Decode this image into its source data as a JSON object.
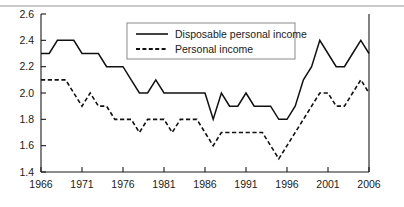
{
  "chart_data": {
    "type": "line",
    "title": "",
    "subtitle": "",
    "xlabel": "",
    "ylabel": "",
    "xlim": [
      1966,
      2006
    ],
    "ylim": [
      1.4,
      2.6
    ],
    "grid": false,
    "legend_position": "top-right",
    "x_tick_labels": [
      "1966",
      "1971",
      "1976",
      "1981",
      "1986",
      "1991",
      "1996",
      "2001",
      "2006"
    ],
    "x_ticks": [
      1966,
      1971,
      1976,
      1981,
      1986,
      1991,
      1996,
      2001,
      2006
    ],
    "y_tick_labels": [
      "1.4",
      "1.6",
      "1.8",
      "2.0",
      "2.2",
      "2.4",
      "2.6"
    ],
    "y_ticks": [
      1.4,
      1.6,
      1.8,
      2.0,
      2.2,
      2.4,
      2.6
    ],
    "x": [
      1966,
      1967,
      1968,
      1969,
      1970,
      1971,
      1972,
      1973,
      1974,
      1975,
      1976,
      1977,
      1978,
      1979,
      1980,
      1981,
      1982,
      1983,
      1984,
      1985,
      1986,
      1987,
      1988,
      1989,
      1990,
      1991,
      1992,
      1993,
      1994,
      1995,
      1996,
      1997,
      1998,
      1999,
      2000,
      2001,
      2002,
      2003,
      2004,
      2005,
      2006
    ],
    "series": [
      {
        "name": "Disposable personal income",
        "style": "solid",
        "values": [
          2.3,
          2.3,
          2.4,
          2.4,
          2.4,
          2.3,
          2.3,
          2.3,
          2.2,
          2.2,
          2.2,
          2.1,
          2.0,
          2.0,
          2.1,
          2.0,
          2.0,
          2.0,
          2.0,
          2.0,
          2.0,
          1.8,
          2.0,
          1.9,
          1.9,
          2.0,
          1.9,
          1.9,
          1.9,
          1.8,
          1.8,
          1.9,
          2.1,
          2.2,
          2.4,
          2.3,
          2.2,
          2.2,
          2.3,
          2.4,
          2.3
        ]
      },
      {
        "name": "Personal income",
        "style": "dashed",
        "values": [
          2.1,
          2.1,
          2.1,
          2.1,
          2.0,
          1.9,
          2.0,
          1.9,
          1.9,
          1.8,
          1.8,
          1.8,
          1.7,
          1.8,
          1.8,
          1.8,
          1.7,
          1.8,
          1.8,
          1.8,
          1.7,
          1.6,
          1.7,
          1.7,
          1.7,
          1.7,
          1.7,
          1.7,
          1.6,
          1.5,
          1.6,
          1.7,
          1.8,
          1.9,
          2.0,
          2.0,
          1.9,
          1.9,
          2.0,
          2.1,
          2.0
        ]
      }
    ],
    "legend": [
      {
        "label": "Disposable personal income",
        "style": "solid"
      },
      {
        "label": "Personal income",
        "style": "dashed"
      }
    ]
  },
  "colors": {
    "line": "#111111",
    "axis": "#1a1a1a",
    "legend_border": "#8a8a8a",
    "background": "#ffffff"
  }
}
